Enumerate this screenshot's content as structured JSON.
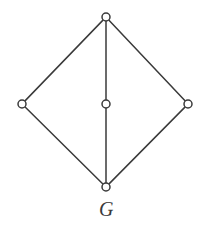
{
  "figure": {
    "label": "G",
    "caption_label": "G",
    "background_color": "#ffffff",
    "stroke_color": "#3a3a3a",
    "vertex_fill_color": "#ffffff"
  },
  "chart_data": {
    "type": "diagram",
    "title": "G",
    "graph_kind": "undirected-graph",
    "vertex_count": 5,
    "edge_count": 6,
    "vertex_radius": 4,
    "stroke_width": 1.5,
    "vertices": [
      {
        "id": "top",
        "label": "",
        "x": 106,
        "y": 17,
        "degree": 3
      },
      {
        "id": "left",
        "label": "",
        "x": 22,
        "y": 104,
        "degree": 2
      },
      {
        "id": "center",
        "label": "",
        "x": 106,
        "y": 104,
        "degree": 2
      },
      {
        "id": "right",
        "label": "",
        "x": 188,
        "y": 104,
        "degree": 2
      },
      {
        "id": "bottom",
        "label": "",
        "x": 106,
        "y": 187,
        "degree": 3
      }
    ],
    "edges": [
      {
        "from": "top",
        "to": "left"
      },
      {
        "from": "top",
        "to": "right"
      },
      {
        "from": "top",
        "to": "center"
      },
      {
        "from": "center",
        "to": "bottom"
      },
      {
        "from": "left",
        "to": "bottom"
      },
      {
        "from": "right",
        "to": "bottom"
      }
    ],
    "xlim": [
      0,
      213
    ],
    "ylim": [
      0,
      227
    ],
    "grid": false,
    "legend": null
  }
}
